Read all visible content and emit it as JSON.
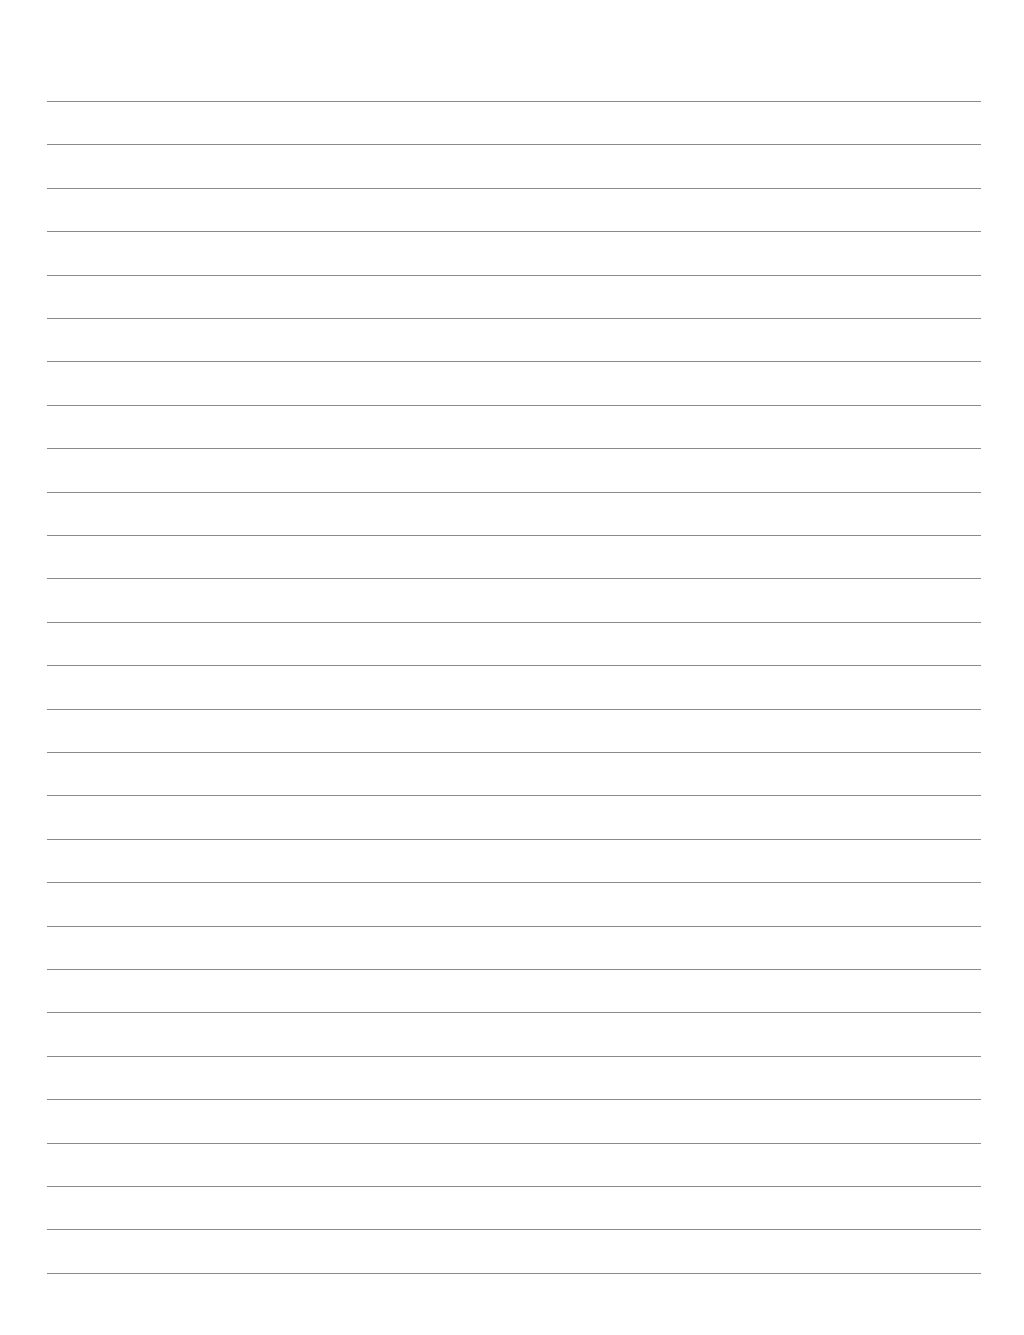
{
  "page": {
    "type": "blank lined paper",
    "line_color": "#8a8a8a",
    "background_color": "#ffffff",
    "line_count": 28,
    "first_line_y": 101,
    "line_spacing": 43.4,
    "line_left": 47,
    "line_right": 981
  }
}
